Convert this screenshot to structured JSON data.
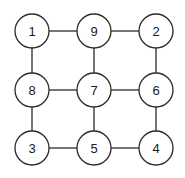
{
  "figure": {
    "title": "",
    "background_color": "#ffffff",
    "stroke_color": "#2b2b2b",
    "node_fill_color": "#ffffff",
    "label_color": "#1a1a1a",
    "node_radius": 17,
    "edge_width": 1.3
  },
  "chart_data": {
    "type": "diagram",
    "diagram_kind": "undirected-graph",
    "layout": "3x3-grid",
    "title": "",
    "xlabel": "",
    "ylabel": "",
    "grid": false,
    "legend": null,
    "nodes": [
      {
        "id": "n1",
        "label": "1",
        "x": 32,
        "y": 31,
        "row": 0,
        "col": 0
      },
      {
        "id": "n9",
        "label": "9",
        "x": 94,
        "y": 31,
        "row": 0,
        "col": 1
      },
      {
        "id": "n2",
        "label": "2",
        "x": 156,
        "y": 31,
        "row": 0,
        "col": 2
      },
      {
        "id": "n8",
        "label": "8",
        "x": 32,
        "y": 90,
        "row": 1,
        "col": 0
      },
      {
        "id": "n7",
        "label": "7",
        "x": 94,
        "y": 90,
        "row": 1,
        "col": 1
      },
      {
        "id": "n6",
        "label": "6",
        "x": 156,
        "y": 90,
        "row": 1,
        "col": 2
      },
      {
        "id": "n3",
        "label": "3",
        "x": 32,
        "y": 148,
        "row": 2,
        "col": 0
      },
      {
        "id": "n5",
        "label": "5",
        "x": 94,
        "y": 148,
        "row": 2,
        "col": 1
      },
      {
        "id": "n4",
        "label": "4",
        "x": 156,
        "y": 148,
        "row": 2,
        "col": 2
      }
    ],
    "edges": [
      {
        "from": "n1",
        "to": "n9"
      },
      {
        "from": "n9",
        "to": "n2"
      },
      {
        "from": "n8",
        "to": "n7"
      },
      {
        "from": "n7",
        "to": "n6"
      },
      {
        "from": "n3",
        "to": "n5"
      },
      {
        "from": "n5",
        "to": "n4"
      },
      {
        "from": "n1",
        "to": "n8"
      },
      {
        "from": "n8",
        "to": "n3"
      },
      {
        "from": "n9",
        "to": "n7"
      },
      {
        "from": "n7",
        "to": "n5"
      },
      {
        "from": "n2",
        "to": "n6"
      },
      {
        "from": "n6",
        "to": "n4"
      }
    ],
    "node_order_reading": [
      "1",
      "9",
      "2",
      "8",
      "7",
      "6",
      "3",
      "5",
      "4"
    ]
  }
}
